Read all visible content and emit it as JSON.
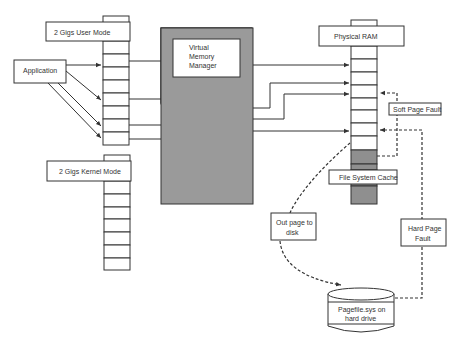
{
  "diagram": {
    "nodes": {
      "application": {
        "label": "Application"
      },
      "user_mode": {
        "label": "2 Gigs User Mode"
      },
      "kernel_mode": {
        "label": "2 Gigs Kernel Mode"
      },
      "vmm": {
        "line1": "Virtual",
        "line2": "Memory",
        "line3": "Manager"
      },
      "physical_ram": {
        "label": "Physical RAM"
      },
      "soft_page_fault": {
        "label": "Soft Page Fault"
      },
      "file_system_cache": {
        "label": "File System Cache"
      },
      "out_page": {
        "line1": "Out page to",
        "line2": "disk"
      },
      "hard_page_fault": {
        "line1": "Hard Page",
        "line2": "Fault"
      },
      "pagefile": {
        "line1": "Pagefile.sys on",
        "line2": "hard drive"
      }
    },
    "edges": [
      {
        "from": "Application",
        "to": "2 Gigs User Mode",
        "count": 4,
        "style": "solid"
      },
      {
        "from": "2 Gigs User Mode",
        "to": "Virtual Memory Manager",
        "count": 4,
        "style": "solid"
      },
      {
        "from": "Virtual Memory Manager",
        "to": "Physical RAM",
        "count": 4,
        "style": "solid"
      },
      {
        "from": "File System Cache",
        "to": "Physical RAM",
        "label": "Soft Page Fault",
        "style": "dashed"
      },
      {
        "from": "Physical RAM",
        "to": "Pagefile.sys on hard drive",
        "label": "Out page to disk",
        "style": "dashed"
      },
      {
        "from": "Pagefile.sys on hard drive",
        "to": "Physical RAM",
        "label": "Hard Page Fault",
        "style": "dashed"
      }
    ],
    "colors": {
      "stroke": "#333333",
      "vmm_fill": "#9a9a9a",
      "cache_fill": "#8f8f8f",
      "background": "#ffffff"
    }
  }
}
